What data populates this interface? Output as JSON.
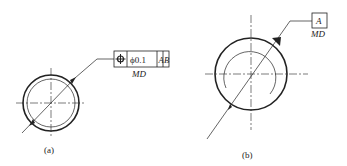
{
  "figure_a": {
    "caption": "(a)",
    "frame": {
      "symbol": "position-icon",
      "tolerance": "ϕ0.1",
      "datum1": "A",
      "datum2": "B",
      "modifier": "MD"
    }
  },
  "figure_b": {
    "caption": "(b)",
    "datum": {
      "label": "A",
      "modifier": "MD"
    }
  },
  "colors": {
    "line": "#222222",
    "background": "#ffffff"
  }
}
